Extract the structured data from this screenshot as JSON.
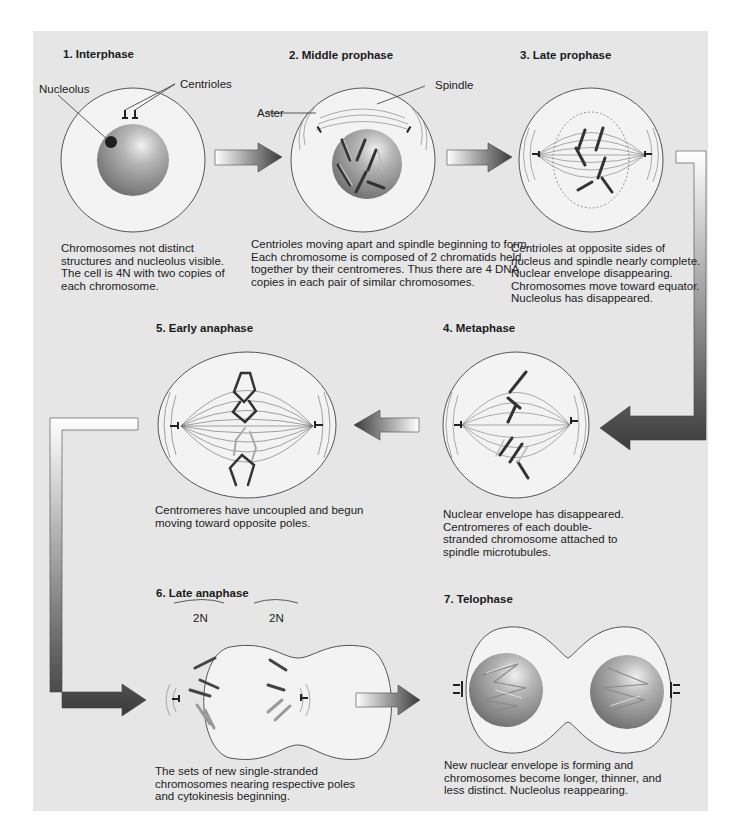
{
  "diagram": {
    "colors": {
      "panel_background": "#e6e6e6",
      "cell_fill": "#f3f3f3",
      "cell_outline": "#555555",
      "nucleus_light": "#e8e8e8",
      "nucleus_dark": "#7a7a7a",
      "nucleolus": "#1e1e1e",
      "arrow_light": "#ffffff",
      "arrow_dark": "#3a3a3a",
      "chromosome_dark": "#3c3c3c",
      "chromosome_light": "#b5b5b5"
    },
    "stages": [
      {
        "number": "1",
        "title": "1. Interphase",
        "labels": [
          "Nucleolus",
          "Centrioles"
        ],
        "caption": [
          "Chromosomes not distinct",
          "structures and nucleolus visible.",
          "The cell is 4N with two copies of",
          "each chromosome."
        ]
      },
      {
        "number": "2",
        "title": "2. Middle prophase",
        "labels": [
          "Aster",
          "Spindle"
        ],
        "caption": [
          "Centrioles moving apart and spindle beginning to form.",
          "Each chromosome is composed of 2 chromatids held",
          "together by their centromeres. Thus there are 4 DNA",
          "copies in each pair of similar chromosomes."
        ]
      },
      {
        "number": "3",
        "title": "3. Late prophase",
        "labels": [],
        "caption": [
          "Centrioles at opposite sides of",
          "nucleus and spindle nearly complete.",
          "Nuclear envelope disappearing.",
          "Chromosomes move toward equator.",
          "Nucleolus has disappeared."
        ]
      },
      {
        "number": "4",
        "title": "4. Metaphase",
        "labels": [],
        "caption": [
          "Nuclear envelope has disappeared.",
          "Centromeres of each double-",
          "stranded chromosome attached to",
          "spindle microtubules."
        ]
      },
      {
        "number": "5",
        "title": "5. Early anaphase",
        "labels": [],
        "caption": [
          "Centromeres have uncoupled and begun",
          "moving toward opposite poles."
        ]
      },
      {
        "number": "6",
        "title": "6. Late anaphase",
        "labels": [
          "2N",
          "2N"
        ],
        "caption": [
          "The sets of new single-stranded",
          "chromosomes nearing respective poles",
          "and cytokinesis beginning."
        ]
      },
      {
        "number": "7",
        "title": "7. Telophase",
        "labels": [],
        "caption": [
          "New nuclear envelope is forming and",
          "chromosomes become longer, thinner, and",
          "less distinct. Nucleolus reappearing."
        ]
      }
    ],
    "flow_arrows": [
      {
        "from": "1",
        "to": "2",
        "shape": "straight-right"
      },
      {
        "from": "2",
        "to": "3",
        "shape": "straight-right"
      },
      {
        "from": "3",
        "to": "4",
        "shape": "elbow-down-left"
      },
      {
        "from": "4",
        "to": "5",
        "shape": "straight-left"
      },
      {
        "from": "5",
        "to": "6",
        "shape": "elbow-down-right"
      },
      {
        "from": "6",
        "to": "7",
        "shape": "straight-right"
      }
    ]
  }
}
